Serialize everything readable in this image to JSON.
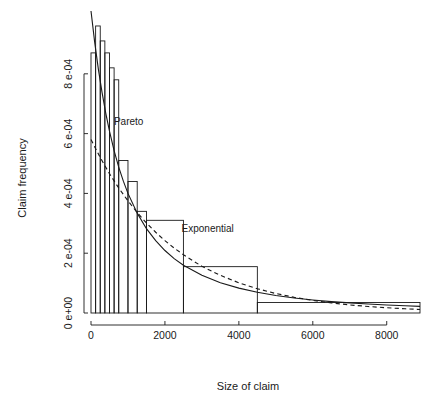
{
  "figure": {
    "background": "#ffffff",
    "ink": "#1a1a1a"
  },
  "chart_data": {
    "type": "bar",
    "title": "",
    "subtitle": "",
    "xlabel": "Size of claim",
    "ylabel": "Claim frequency",
    "xlim": [
      0,
      8900
    ],
    "ylim": [
      0,
      0.00098
    ],
    "grid": false,
    "legend_position": "inline-annotations",
    "xticks": [
      0,
      2000,
      4000,
      6000,
      8000
    ],
    "xticklabels": [
      "0",
      "2000",
      "4000",
      "6000",
      "8000"
    ],
    "yticks": [
      0,
      0.0002,
      0.0004,
      0.0006,
      0.0008
    ],
    "yticklabels": [
      "0 e+00",
      "2 e-04",
      "4 e-04",
      "6 e-04",
      "8 e-04"
    ],
    "histogram": {
      "name": "Claim size histogram (density)",
      "bin_edges": [
        0,
        125,
        250,
        375,
        500,
        625,
        750,
        1000,
        1250,
        1500,
        2500,
        4500,
        8900
      ],
      "densities": [
        0.00087,
        0.00096,
        0.00091,
        0.00087,
        0.00082,
        0.00078,
        0.00051,
        0.00044,
        0.00034,
        0.00031,
        0.000155,
        3.5e-05
      ],
      "fill": "none",
      "stroke": "#1a1a1a"
    },
    "series": [
      {
        "name": "Pareto",
        "style": "solid",
        "label": "Pareto",
        "label_x": 620,
        "label_y": 0.00063,
        "x": [
          0,
          100,
          200,
          300,
          400,
          500,
          625,
          750,
          875,
          1000,
          1250,
          1500,
          1750,
          2000,
          2250,
          2500,
          3000,
          3500,
          4000,
          4500,
          5000,
          5500,
          6000,
          6500,
          7000,
          7500,
          8000,
          8500,
          8900
        ],
        "y": [
          0.00101,
          0.000905,
          0.000815,
          0.000737,
          0.000668,
          0.000608,
          0.000543,
          0.000488,
          0.000441,
          0.0004,
          0.000334,
          0.000282,
          0.000242,
          0.000209,
          0.000182,
          0.00016,
          0.000126,
          0.000101,
          8.32e-05,
          6.94e-05,
          5.88e-05,
          5.04e-05,
          4.37e-05,
          3.82e-05,
          3.37e-05,
          2.99e-05,
          2.67e-05,
          2.4e-05,
          2.21e-05
        ]
      },
      {
        "name": "Exponential",
        "style": "dashed",
        "label": "Exponential",
        "label_x": 2450,
        "label_y": 0.000272,
        "x": [
          0,
          250,
          500,
          750,
          1000,
          1250,
          1500,
          1750,
          2000,
          2250,
          2500,
          3000,
          3500,
          4000,
          4500,
          5000,
          5500,
          6000,
          6500,
          7000,
          7500,
          8000,
          8500,
          8900
        ],
        "y": [
          0.00058,
          0.00052,
          0.000466,
          0.000418,
          0.000375,
          0.000336,
          0.000301,
          0.00027,
          0.000242,
          0.000217,
          0.000195,
          0.000156,
          0.000126,
          0.000101,
          8.12e-05,
          6.52e-05,
          5.24e-05,
          4.21e-05,
          3.38e-05,
          2.71e-05,
          2.18e-05,
          1.75e-05,
          1.41e-05,
          1.18e-05
        ]
      }
    ]
  }
}
